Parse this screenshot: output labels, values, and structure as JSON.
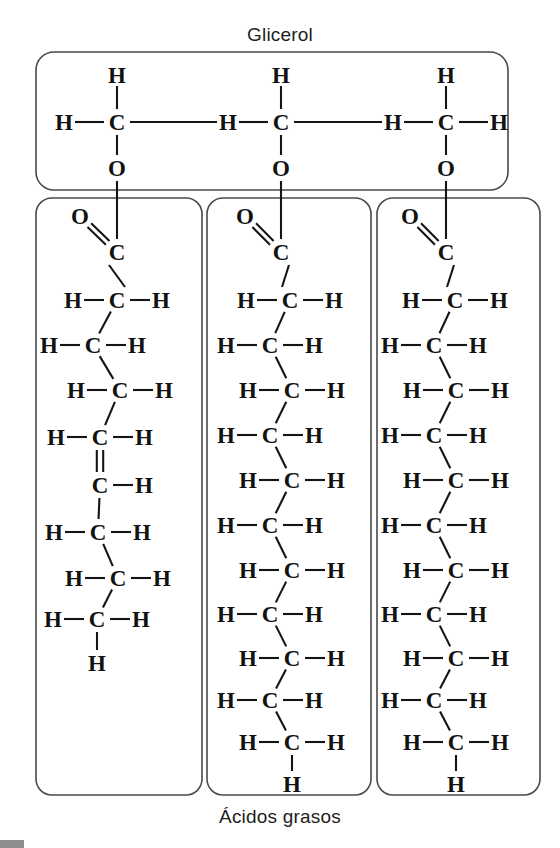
{
  "figure": {
    "title_top": "Glicerol",
    "title_bottom": "Ácidos grasos",
    "language": "es"
  },
  "colors": {
    "ink": "#121212",
    "panel_border": "#4a4a4a",
    "panel_light": "#eceaea",
    "panel_mid": "#cfcdcd",
    "panel_dark": "#a9a7a7",
    "background": "#ffffff"
  },
  "chart_data": {
    "type": "diagram",
    "title": "Glicerol",
    "subtitle": "Ácidos grasos",
    "layout": {
      "glycerol_panel": {
        "x": 36,
        "y": 52,
        "w": 472,
        "h": 138,
        "radius": 18
      },
      "fatty_panels": [
        {
          "x": 36,
          "y": 198,
          "w": 166,
          "h": 597,
          "radius": 16
        },
        {
          "x": 207,
          "y": 198,
          "w": 164,
          "h": 597,
          "radius": 16
        },
        {
          "x": 377,
          "y": 198,
          "w": 163,
          "h": 597,
          "radius": 16
        }
      ]
    },
    "glycerol": {
      "label": "Glicerol",
      "carbons": [
        {
          "id": "C1",
          "x": 117,
          "y": 122,
          "symbol": "C",
          "h_left": {
            "symbol": "H",
            "x": 64
          },
          "h_top": {
            "symbol": "H",
            "y": 75
          },
          "o_below": {
            "symbol": "O",
            "y": 168
          }
        },
        {
          "id": "C2",
          "x": 281,
          "y": 122,
          "symbol": "C",
          "h_left": {
            "symbol": "H",
            "x": 228
          },
          "h_top": {
            "symbol": "H",
            "y": 75
          },
          "o_below": {
            "symbol": "O",
            "y": 168
          }
        },
        {
          "id": "C3",
          "x": 446,
          "y": 122,
          "symbol": "C",
          "h_left": {
            "symbol": "H",
            "x": 393
          },
          "h_right": {
            "symbol": "H",
            "x": 499
          },
          "h_top": {
            "symbol": "H",
            "y": 75
          },
          "o_below": {
            "symbol": "O",
            "y": 168
          }
        }
      ],
      "backbone_bonds": [
        {
          "from": "C1",
          "to": "C2-H"
        },
        {
          "from": "C2",
          "to": "C3-H"
        }
      ]
    },
    "fatty_acids": [
      {
        "name": "unsaturated-fatty-acid",
        "index": 1,
        "saturated": false,
        "carbon_count": 9,
        "double_bonds": [
          {
            "between": [
              4,
              5
            ],
            "type": "C=C"
          }
        ],
        "carbonyl": {
          "symbol": "C",
          "x": 117,
          "y": 252,
          "oxygen": {
            "symbol": "O",
            "x": 80,
            "y": 216
          },
          "bond": "C=O"
        },
        "ester_link_to_glycerol": true,
        "chain": [
          {
            "n": 1,
            "symbol": "C",
            "x": 117,
            "y": 300,
            "h_left": "H",
            "h_right": "H"
          },
          {
            "n": 2,
            "symbol": "C",
            "x": 93,
            "y": 345,
            "h_left": "H",
            "h_right": "H"
          },
          {
            "n": 3,
            "symbol": "C",
            "x": 120,
            "y": 390,
            "h_left": "H",
            "h_right": "H"
          },
          {
            "n": 4,
            "symbol": "C",
            "x": 100,
            "y": 437,
            "h_left": "H",
            "h_right": "H"
          },
          {
            "n": 5,
            "symbol": "C",
            "x": 100,
            "y": 485,
            "h_right": "H"
          },
          {
            "n": 6,
            "symbol": "C",
            "x": 98,
            "y": 532,
            "h_left": "H",
            "h_right": "H"
          },
          {
            "n": 7,
            "symbol": "C",
            "x": 118,
            "y": 578,
            "h_left": "H",
            "h_right": "H"
          },
          {
            "n": 8,
            "symbol": "C",
            "x": 97,
            "y": 619,
            "h_left": "H",
            "h_right": "H"
          },
          {
            "n": 9,
            "symbol": "H",
            "x": 97,
            "y": 663,
            "terminal": true
          }
        ]
      },
      {
        "name": "saturated-fatty-acid-a",
        "index": 2,
        "saturated": true,
        "carbon_count": 12,
        "double_bonds": [],
        "carbonyl": {
          "symbol": "C",
          "x": 281,
          "y": 252,
          "oxygen": {
            "symbol": "O",
            "x": 245,
            "y": 216
          },
          "bond": "C=O"
        },
        "ester_link_to_glycerol": true,
        "chain": [
          {
            "n": 1,
            "symbol": "C",
            "x": 290,
            "y": 300,
            "h_left": "H",
            "h_right": "H"
          },
          {
            "n": 2,
            "symbol": "C",
            "x": 270,
            "y": 345,
            "h_left": "H",
            "h_right": "H"
          },
          {
            "n": 3,
            "symbol": "C",
            "x": 292,
            "y": 390,
            "h_left": "H",
            "h_right": "H"
          },
          {
            "n": 4,
            "symbol": "C",
            "x": 270,
            "y": 435,
            "h_left": "H",
            "h_right": "H"
          },
          {
            "n": 5,
            "symbol": "C",
            "x": 292,
            "y": 480,
            "h_left": "H",
            "h_right": "H"
          },
          {
            "n": 6,
            "symbol": "C",
            "x": 270,
            "y": 525,
            "h_left": "H",
            "h_right": "H"
          },
          {
            "n": 7,
            "symbol": "C",
            "x": 292,
            "y": 570,
            "h_left": "H",
            "h_right": "H"
          },
          {
            "n": 8,
            "symbol": "C",
            "x": 270,
            "y": 614,
            "h_left": "H",
            "h_right": "H"
          },
          {
            "n": 9,
            "symbol": "C",
            "x": 292,
            "y": 658,
            "h_left": "H",
            "h_right": "H"
          },
          {
            "n": 10,
            "symbol": "C",
            "x": 270,
            "y": 700,
            "h_left": "H",
            "h_right": "H"
          },
          {
            "n": 11,
            "symbol": "C",
            "x": 292,
            "y": 742,
            "h_left": "H",
            "h_right": "H"
          },
          {
            "n": 12,
            "symbol": "H",
            "x": 292,
            "y": 784,
            "terminal": true
          }
        ]
      },
      {
        "name": "saturated-fatty-acid-b",
        "index": 3,
        "saturated": true,
        "carbon_count": 12,
        "double_bonds": [],
        "carbonyl": {
          "symbol": "C",
          "x": 446,
          "y": 252,
          "oxygen": {
            "symbol": "O",
            "x": 410,
            "y": 216
          },
          "bond": "C=O"
        },
        "ester_link_to_glycerol": true,
        "chain": [
          {
            "n": 1,
            "symbol": "C",
            "x": 455,
            "y": 300,
            "h_left": "H",
            "h_right": "H"
          },
          {
            "n": 2,
            "symbol": "C",
            "x": 434,
            "y": 345,
            "h_left": "H",
            "h_right": "H"
          },
          {
            "n": 3,
            "symbol": "C",
            "x": 456,
            "y": 390,
            "h_left": "H",
            "h_right": "H"
          },
          {
            "n": 4,
            "symbol": "C",
            "x": 434,
            "y": 435,
            "h_left": "H",
            "h_right": "H"
          },
          {
            "n": 5,
            "symbol": "C",
            "x": 456,
            "y": 480,
            "h_left": "H",
            "h_right": "H"
          },
          {
            "n": 6,
            "symbol": "C",
            "x": 434,
            "y": 525,
            "h_left": "H",
            "h_right": "H"
          },
          {
            "n": 7,
            "symbol": "C",
            "x": 456,
            "y": 570,
            "h_left": "H",
            "h_right": "H"
          },
          {
            "n": 8,
            "symbol": "C",
            "x": 434,
            "y": 614,
            "h_left": "H",
            "h_right": "H"
          },
          {
            "n": 9,
            "symbol": "C",
            "x": 456,
            "y": 658,
            "h_left": "H",
            "h_right": "H"
          },
          {
            "n": 10,
            "symbol": "C",
            "x": 434,
            "y": 700,
            "h_left": "H",
            "h_right": "H"
          },
          {
            "n": 11,
            "symbol": "C",
            "x": 456,
            "y": 742,
            "h_left": "H",
            "h_right": "H"
          },
          {
            "n": 12,
            "symbol": "H",
            "x": 456,
            "y": 784,
            "terminal": true
          }
        ]
      }
    ],
    "symbols": {
      "carbon": "C",
      "hydrogen": "H",
      "oxygen": "O"
    }
  }
}
